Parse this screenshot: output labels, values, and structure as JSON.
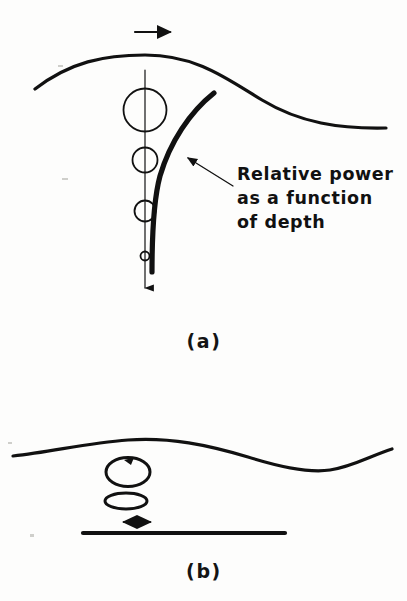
{
  "figure": {
    "background_color": "#fdfdfc",
    "ink_color": "#111111",
    "width": 407,
    "height": 601
  },
  "panel_a": {
    "caption": "(a)",
    "caption_x": 204,
    "caption_y": 348,
    "propagation_arrow": {
      "name": "wave-propagation-direction",
      "direction": "right",
      "x1": 135,
      "x2": 172,
      "y": 32
    },
    "water_surface": {
      "name": "water-surface-profile",
      "path": "M 35 89 C 70 62 104 55 145 55 C 196 55 226 78 262 100 C 300 123 340 129 386 128"
    },
    "orbital_circles": [
      {
        "label": "surface-orbit",
        "cx": 145,
        "cy": 110,
        "r": 21.5
      },
      {
        "label": "shallow-orbit",
        "cx": 145,
        "cy": 160,
        "r": 12.5
      },
      {
        "label": "mid-orbit",
        "cx": 145,
        "cy": 211,
        "r": 10.5
      },
      {
        "label": "deep-orbit",
        "cx": 145,
        "cy": 256,
        "r": 4.5
      }
    ],
    "depth_axis": {
      "name": "depth-axis",
      "x": 145,
      "y_top": 70,
      "y_bottom": 292,
      "arrow_direction": "down"
    },
    "power_curve": {
      "name": "relative-power-curve",
      "path": "M 214 93 C 190 112 170 142 160 176 C 153 202 152 236 152 272"
    },
    "leader": {
      "name": "annotation-leader",
      "from_x": 233,
      "from_y": 186,
      "to_x": 186,
      "to_y": 157
    },
    "annotation": {
      "name": "relative-power-annotation",
      "x": 237,
      "lines": [
        {
          "text": "Relative power",
          "y": 180
        },
        {
          "text": "as a function",
          "y": 204
        },
        {
          "text": "of depth",
          "y": 228
        }
      ]
    }
  },
  "panel_b": {
    "caption": "(b)",
    "caption_x": 204,
    "caption_y": 578,
    "water_surface": {
      "name": "shallow-water-surface-profile",
      "path": "M 13 456 C 52 452 86 443 128 440 C 170 437 208 445 248 457 C 283 468 310 473 330 470 C 352 467 370 456 392 449"
    },
    "orbital_ellipses": [
      {
        "label": "upper-orbit-ellipse",
        "cx": 128,
        "cy": 472,
        "rx": 22,
        "ry": 14.5,
        "has_rotation_arrow": true
      },
      {
        "label": "lower-orbit-ellipse",
        "cx": 126,
        "cy": 501,
        "rx": 21,
        "ry": 8,
        "has_rotation_arrow": false
      }
    ],
    "horizontal_motion_arrow": {
      "name": "horizontal-particle-motion-arrow",
      "x1": 122,
      "x2": 152,
      "y": 522,
      "direction": "both"
    },
    "seabed": {
      "name": "seabed-line",
      "x1": 83,
      "x2": 285,
      "y": 533
    }
  }
}
